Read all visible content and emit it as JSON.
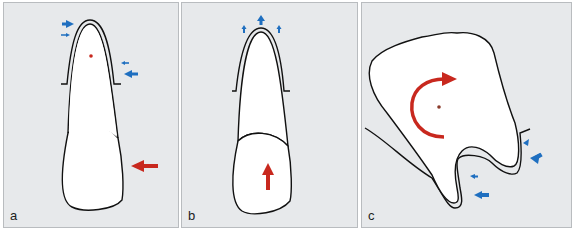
{
  "figure": {
    "panels": [
      {
        "id": "a",
        "label": "a",
        "subject": "single-rooted tooth (incisor)",
        "force": {
          "direction": "horizontal-left",
          "applied_at": "crown",
          "color": "#c8281e"
        },
        "rotation_center_marker": {
          "color": "#c8281e",
          "position": "upper root"
        },
        "pressure_arrows": {
          "color": "#1f6fc0",
          "locations": [
            "apex left (pointing right)",
            "cervical right (pointing left)"
          ]
        }
      },
      {
        "id": "b",
        "label": "b",
        "subject": "single-rooted tooth (incisor)",
        "force": {
          "direction": "vertical-up (intrusive)",
          "applied_at": "crown",
          "color": "#c8281e"
        },
        "pressure_arrows": {
          "color": "#1f6fc0",
          "locations": [
            "apex (pointing up, three arrows)"
          ]
        }
      },
      {
        "id": "c",
        "label": "c",
        "subject": "multi-rooted tooth (molar), tipped",
        "force": {
          "direction": "clockwise rotation (moment)",
          "applied_at": "crown",
          "color": "#c8281e"
        },
        "rotation_center_marker": {
          "color": "#c8281e",
          "position": "crown center"
        },
        "pressure_arrows": {
          "color": "#1f6fc0",
          "locations": [
            "distal root right side (pointing left-down)",
            "mesial root right side (pointing left)"
          ]
        }
      }
    ],
    "colors": {
      "background": "#e7e9eb",
      "tooth_fill": "#ffffff",
      "outline": "#111111",
      "force_arrow": "#c8281e",
      "pressure_arrow": "#1f6fc0"
    }
  }
}
